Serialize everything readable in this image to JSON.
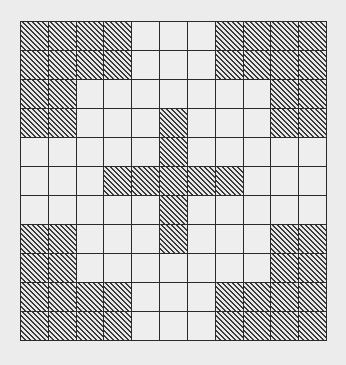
{
  "figure": {
    "rows": 11,
    "columns": 11,
    "colors": {
      "background": "#ececec",
      "grid_line": "#2a2a2a",
      "hatch": "#3a3a3a"
    },
    "hatched_pattern": [
      [
        1,
        1,
        1,
        1,
        0,
        0,
        0,
        1,
        1,
        1,
        1
      ],
      [
        1,
        1,
        1,
        1,
        0,
        0,
        0,
        1,
        1,
        1,
        1
      ],
      [
        1,
        1,
        0,
        0,
        0,
        0,
        0,
        0,
        0,
        1,
        1
      ],
      [
        1,
        1,
        0,
        0,
        0,
        1,
        0,
        0,
        0,
        1,
        1
      ],
      [
        0,
        0,
        0,
        0,
        0,
        1,
        0,
        0,
        0,
        0,
        0
      ],
      [
        0,
        0,
        0,
        1,
        1,
        1,
        1,
        1,
        0,
        0,
        0
      ],
      [
        0,
        0,
        0,
        0,
        0,
        1,
        0,
        0,
        0,
        0,
        0
      ],
      [
        1,
        1,
        0,
        0,
        0,
        1,
        0,
        0,
        0,
        1,
        1
      ],
      [
        1,
        1,
        0,
        0,
        0,
        0,
        0,
        0,
        0,
        1,
        1
      ],
      [
        1,
        1,
        1,
        1,
        0,
        0,
        0,
        1,
        1,
        1,
        1
      ],
      [
        1,
        1,
        1,
        1,
        0,
        0,
        0,
        1,
        1,
        1,
        1
      ]
    ]
  }
}
